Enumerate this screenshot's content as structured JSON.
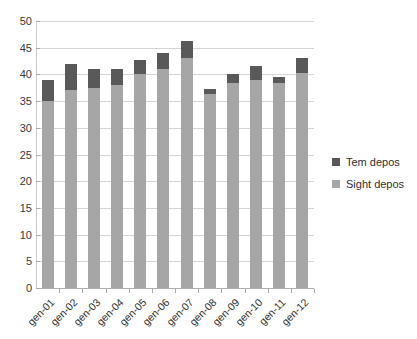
{
  "chart_data": {
    "type": "bar",
    "stacked": true,
    "title": "",
    "xlabel": "",
    "ylabel": "",
    "ylim": [
      0,
      50
    ],
    "ytick_step": 5,
    "yticks": [
      "50",
      "45",
      "40",
      "35",
      "30",
      "25",
      "20",
      "15",
      "10",
      "5",
      "0"
    ],
    "grid": true,
    "legend_position": "right",
    "categories": [
      "gen-01",
      "gen-02",
      "gen-03",
      "gen-04",
      "gen-05",
      "gen-06",
      "gen-07",
      "gen-08",
      "gen-09",
      "gen-10",
      "gen-11",
      "gen-12"
    ],
    "series": [
      {
        "name": "Sight depos",
        "color": "#a6a6a6",
        "values": [
          35.0,
          37.0,
          37.5,
          38.0,
          40.0,
          41.0,
          43.0,
          36.3,
          38.3,
          39.0,
          38.3,
          40.3
        ]
      },
      {
        "name": "Tem depos",
        "color": "#595959",
        "values": [
          4.0,
          5.0,
          3.5,
          3.0,
          2.7,
          3.0,
          3.2,
          1.0,
          1.7,
          2.5,
          1.2,
          2.7
        ]
      }
    ],
    "totals": [
      39.0,
      42.0,
      41.0,
      41.0,
      42.7,
      44.0,
      46.2,
      37.3,
      40.0,
      41.5,
      39.5,
      43.0
    ]
  },
  "legend": {
    "entries": [
      {
        "label": "Tem depos",
        "color": "#595959"
      },
      {
        "label": "Sight depos",
        "color": "#a6a6a6"
      }
    ]
  },
  "colors": {
    "tem_depos": "#595959",
    "sight_depos": "#a6a6a6",
    "gridline": "#d4d4d4",
    "axis": "#b0b0b0",
    "text": "#2f2f2f",
    "background": "#ffffff"
  }
}
